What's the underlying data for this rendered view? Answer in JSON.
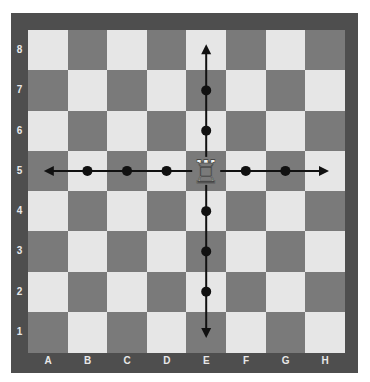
{
  "board": {
    "files": [
      "A",
      "B",
      "C",
      "D",
      "E",
      "F",
      "G",
      "H"
    ],
    "ranks": [
      "8",
      "7",
      "6",
      "5",
      "4",
      "3",
      "2",
      "1"
    ],
    "colors": {
      "light": "#e6e6e6",
      "dark": "#7a7a7a",
      "frame": "#4e4e4e",
      "marker": "#111111"
    }
  },
  "piece": {
    "type": "rook",
    "color": "white",
    "square": "E5",
    "glyph": "♖"
  },
  "moves": {
    "markers": [
      "B5",
      "C5",
      "D5",
      "F5",
      "G5",
      "E7",
      "E6",
      "E4",
      "E3",
      "E2"
    ],
    "arrow_ends": [
      "A5",
      "H5",
      "E8",
      "E1"
    ]
  }
}
